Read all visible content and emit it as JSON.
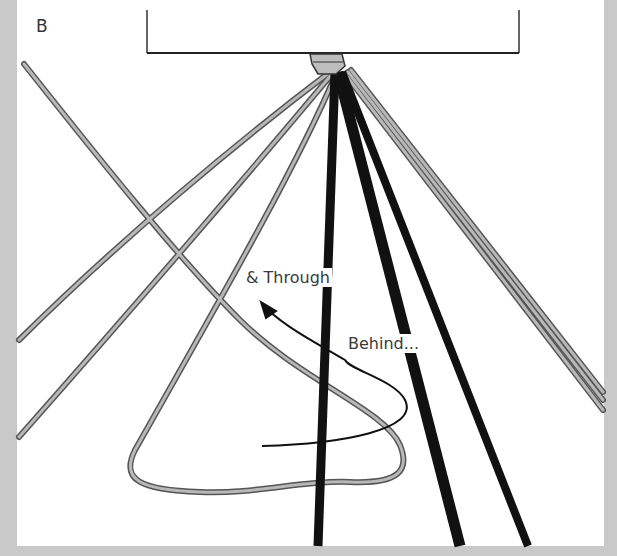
{
  "diagram": {
    "step_label": "B",
    "annotations": {
      "through": "& Through",
      "behind": "Behind..."
    },
    "colors": {
      "background_frame": "#c9c9c9",
      "panel": "#ffffff",
      "dark_cord": "#111111",
      "light_cord_fill": "#b5b5b5",
      "light_cord_outline": "#555555",
      "arrow": "#111111"
    },
    "elements": [
      "dowel-bar",
      "gathering-knot",
      "dark-cords",
      "light-cords",
      "working-cord-loop",
      "direction-arrow"
    ]
  }
}
